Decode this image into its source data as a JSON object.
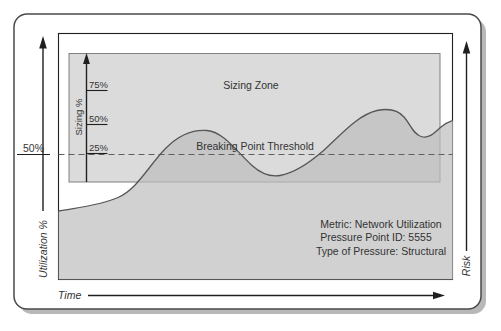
{
  "diagram": {
    "left_axis": {
      "label": "Utilization %",
      "tick_label": "50%"
    },
    "bottom_axis": {
      "label": "Time"
    },
    "right_axis": {
      "label": "Risk"
    },
    "sizing_zone": {
      "title": "Sizing Zone",
      "axis_label": "Sizing %",
      "ticks": [
        "75%",
        "50%",
        "25%"
      ]
    },
    "threshold_label": "Breaking Point Threshold",
    "info": {
      "metric": "Metric: Network Utilization",
      "pressure_point": "Pressure Point ID: 5555",
      "pressure_type": "Type of Pressure: Structural"
    },
    "colors": {
      "frame_border": "#4a4a4a",
      "frame_shadow": "#ababab",
      "plot_border": "#1f1f1f",
      "zone_fill": "#dbdbdb",
      "zone_border": "#808080",
      "curve_fill": "#bebebe",
      "curve_stroke": "#565656",
      "threshold_dash": "#5f5f5f",
      "text": "#333333"
    }
  }
}
